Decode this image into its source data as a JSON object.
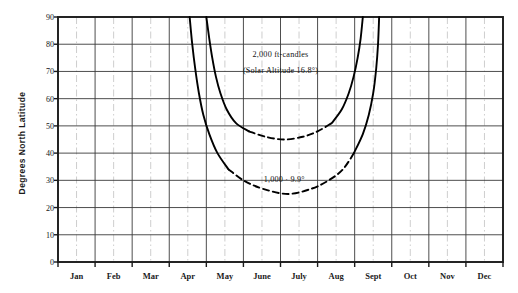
{
  "chart_data": {
    "type": "line",
    "title": "",
    "subtitle": "",
    "xlabel": "",
    "ylabel": "Degrees North Latitude",
    "xlim": [
      0,
      12
    ],
    "ylim": [
      0,
      90
    ],
    "ytick_step": 10,
    "grid": true,
    "legend_position": "inline-annotation",
    "categories": [
      "Jan",
      "Feb",
      "Mar",
      "Apr",
      "May",
      "June",
      "July",
      "Aug",
      "Sept",
      "Oct",
      "Nov",
      "Dec"
    ],
    "ytick_labels": [
      "0",
      "10",
      "20",
      "30",
      "40",
      "50",
      "60",
      "70",
      "80",
      "90"
    ],
    "annotations": [
      {
        "id": "annot-2000-line1",
        "text": "2,000 ft-candles",
        "x_month": 6.0,
        "y_latitude": 76
      },
      {
        "id": "annot-2000-line2",
        "text": "(Solar Altitude 16.8°)",
        "x_month": 6.0,
        "y_latitude": 70
      },
      {
        "id": "annot-1000",
        "text": "1,000 · 9.9°",
        "x_month": 6.1,
        "y_latitude": 30
      }
    ],
    "series": [
      {
        "name": "2,000 ft-candles (Solar Altitude 16.8°)",
        "style": "solid-with-dashed-trough",
        "color": "#000000",
        "min_latitude": 45,
        "min_at_month": 6.1,
        "crosses_90_at_months": [
          4.0,
          8.2
        ],
        "points": [
          {
            "x": 4.0,
            "y": 90
          },
          {
            "x": 4.08,
            "y": 82
          },
          {
            "x": 4.16,
            "y": 75
          },
          {
            "x": 4.26,
            "y": 68
          },
          {
            "x": 4.38,
            "y": 62
          },
          {
            "x": 4.55,
            "y": 56
          },
          {
            "x": 4.8,
            "y": 51
          },
          {
            "x": 5.15,
            "y": 48
          },
          {
            "x": 5.6,
            "y": 46
          },
          {
            "x": 6.1,
            "y": 45
          },
          {
            "x": 6.6,
            "y": 46
          },
          {
            "x": 7.0,
            "y": 48
          },
          {
            "x": 7.38,
            "y": 51
          },
          {
            "x": 7.65,
            "y": 56
          },
          {
            "x": 7.84,
            "y": 62
          },
          {
            "x": 7.97,
            "y": 68
          },
          {
            "x": 8.08,
            "y": 75
          },
          {
            "x": 8.16,
            "y": 82
          },
          {
            "x": 8.22,
            "y": 90
          }
        ],
        "dashed_segment_x_range": [
          4.85,
          7.45
        ]
      },
      {
        "name": "1,000 ft-candles (Solar Altitude 9.9°)",
        "style": "solid-with-dashed-trough",
        "color": "#000000",
        "min_latitude": 25,
        "min_at_month": 6.2,
        "crosses_90_at_months": [
          3.55,
          8.65
        ],
        "points": [
          {
            "x": 3.55,
            "y": 90
          },
          {
            "x": 3.62,
            "y": 80
          },
          {
            "x": 3.7,
            "y": 71
          },
          {
            "x": 3.8,
            "y": 62
          },
          {
            "x": 3.92,
            "y": 54
          },
          {
            "x": 4.08,
            "y": 47
          },
          {
            "x": 4.3,
            "y": 40
          },
          {
            "x": 4.6,
            "y": 34
          },
          {
            "x": 5.0,
            "y": 30
          },
          {
            "x": 5.5,
            "y": 27
          },
          {
            "x": 6.2,
            "y": 25
          },
          {
            "x": 6.85,
            "y": 27
          },
          {
            "x": 7.3,
            "y": 30
          },
          {
            "x": 7.68,
            "y": 34
          },
          {
            "x": 7.98,
            "y": 40
          },
          {
            "x": 8.22,
            "y": 47
          },
          {
            "x": 8.38,
            "y": 54
          },
          {
            "x": 8.5,
            "y": 62
          },
          {
            "x": 8.58,
            "y": 71
          },
          {
            "x": 8.63,
            "y": 80
          },
          {
            "x": 8.66,
            "y": 90
          }
        ],
        "dashed_segment_x_range": [
          4.45,
          8.05
        ]
      }
    ]
  },
  "axes": {
    "frame_color": "#1a1a1a",
    "grid_color_major": "#3a3a3a",
    "grid_color_minor": "#b9b9b9",
    "background": "#ffffff"
  }
}
